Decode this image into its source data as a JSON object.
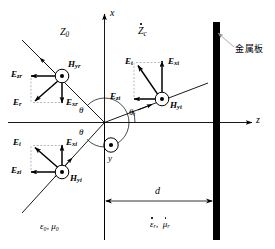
{
  "figure": {
    "header_text": "",
    "axes": {
      "x_label": "x",
      "z_label": "z",
      "y_label": "y",
      "y_marker": "out-of-page-dot"
    },
    "media": {
      "region_left_impedance": "Z",
      "region_left_impedance_sub": "0",
      "region_right_impedance": "Z",
      "region_right_impedance_sub": "c",
      "left_constitutive": "ε₀,  μ₀",
      "right_constitutive_eps": "ε",
      "right_constitutive_eps_sub": "r",
      "right_constitutive_mu": "μ",
      "right_constitutive_mu_sub": "r"
    },
    "plate": {
      "label": "金属板",
      "color": "#000000"
    },
    "dimension": {
      "label": "d"
    },
    "angles": [
      {
        "name": "theta-incident",
        "label": "θ"
      },
      {
        "name": "theta-reflected",
        "label": "θ"
      },
      {
        "name": "theta-transmitted",
        "label": "θ",
        "sub": "t"
      }
    ],
    "vectors": {
      "incident": [
        {
          "name": "E-i",
          "label": "E",
          "sub": "i"
        },
        {
          "name": "E-xi",
          "label": "E",
          "sub": "xi"
        },
        {
          "name": "E-zi",
          "label": "E",
          "sub": "zi"
        },
        {
          "name": "H-yi",
          "label": "H",
          "sub": "yi"
        }
      ],
      "reflected": [
        {
          "name": "E-r",
          "label": "E",
          "sub": "r"
        },
        {
          "name": "E-xr",
          "label": "E",
          "sub": "xr"
        },
        {
          "name": "E-zr",
          "label": "E",
          "sub": "zr"
        },
        {
          "name": "H-yr",
          "label": "H",
          "sub": "yr"
        }
      ],
      "transmitted": [
        {
          "name": "E-t",
          "label": "E",
          "sub": "t"
        },
        {
          "name": "E-xt",
          "label": "E",
          "sub": "xt"
        },
        {
          "name": "E-zt",
          "label": "E",
          "sub": "zt"
        },
        {
          "name": "H-yt",
          "label": "H",
          "sub": "yt"
        }
      ]
    }
  }
}
